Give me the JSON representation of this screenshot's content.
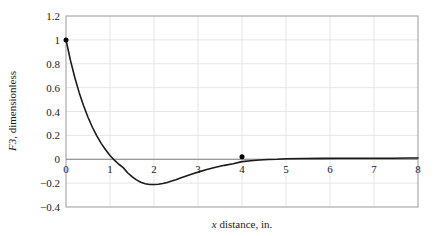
{
  "chart_data": {
    "type": "line",
    "title": "",
    "xlabel": "x distance, in.",
    "ylabel": "F3, dimensionless",
    "ylabel_italic_part": "F3",
    "ylabel_rest_part": ", dimensionless",
    "xlabel_italic_part": "x",
    "xlabel_rest_part": " distance, in.",
    "xlim": [
      0,
      8
    ],
    "ylim": [
      -0.4,
      1.2
    ],
    "xticks": [
      0,
      1,
      2,
      3,
      4,
      5,
      6,
      7,
      8
    ],
    "xticklabels": [
      "0",
      "1",
      "2",
      "3",
      "4",
      "5",
      "6",
      "7",
      "8"
    ],
    "yticks": [
      -0.4,
      -0.2,
      0,
      0.2,
      0.4,
      0.6,
      0.8,
      1,
      1.2
    ],
    "yticklabels": [
      "−0.4",
      "−0.2",
      "0",
      "0.2",
      "0.4",
      "0.6",
      "0.8",
      "1",
      "1.2"
    ],
    "grid": true,
    "grid_color": "#e6e6e6",
    "zero_line": true,
    "zero_line_color": "#808080",
    "frame_color": "#9a9a9a",
    "line_color": "#1a1a1a",
    "line_width": 1.6,
    "legend": null,
    "series": [
      {
        "name": "F3",
        "marker_points": [
          {
            "x": 0,
            "y": 1.0
          },
          {
            "x": 4,
            "y": 0.02
          }
        ],
        "marker_color": "#000000",
        "marker_size": 5,
        "x": [
          0,
          0.1,
          0.2,
          0.3,
          0.4,
          0.5,
          0.6,
          0.7,
          0.8,
          0.9,
          1.0,
          1.1,
          1.2,
          1.3,
          1.4,
          1.5,
          1.6,
          1.7,
          1.8,
          1.9,
          2.0,
          2.1,
          2.2,
          2.3,
          2.4,
          2.5,
          2.6,
          2.7,
          2.8,
          2.9,
          3.0,
          3.2,
          3.4,
          3.6,
          3.8,
          4.0,
          4.2,
          4.4,
          4.6,
          4.8,
          5.0,
          5.4,
          5.8,
          6.2,
          6.6,
          7.0,
          7.4,
          7.8,
          8.0
        ],
        "y": [
          1.0,
          0.856,
          0.725,
          0.607,
          0.501,
          0.406,
          0.322,
          0.248,
          0.183,
          0.127,
          0.078,
          0.037,
          0.002,
          -0.027,
          -0.051,
          -0.07,
          -0.086,
          -0.098,
          -0.106,
          -0.112,
          -0.115,
          -0.116,
          -0.115,
          -0.112,
          -0.108,
          -0.103,
          -0.097,
          -0.091,
          -0.085,
          -0.078,
          -0.072,
          -0.059,
          -0.047,
          -0.037,
          -0.028,
          -0.021,
          -0.015,
          -0.011,
          -0.007,
          -0.005,
          -0.003,
          -0.001,
          0.0,
          0.0,
          0.0,
          0.0,
          0.0,
          0.0,
          0.0
        ],
        "y_rendered": [
          1.0,
          0.83,
          0.685,
          0.558,
          0.448,
          0.352,
          0.268,
          0.196,
          0.133,
          0.079,
          0.032,
          -0.008,
          -0.042,
          -0.07,
          -0.113,
          -0.146,
          -0.173,
          -0.193,
          -0.205,
          -0.211,
          -0.212,
          -0.209,
          -0.203,
          -0.194,
          -0.183,
          -0.171,
          -0.158,
          -0.145,
          -0.132,
          -0.12,
          -0.108,
          -0.086,
          -0.067,
          -0.051,
          -0.037,
          -0.02,
          -0.012,
          -0.006,
          -0.002,
          0.0,
          0.004,
          0.006,
          0.007,
          0.008,
          0.008,
          0.009,
          0.009,
          0.01,
          0.01
        ],
        "min_point": {
          "x": 1.87,
          "y": -0.212
        },
        "zero_crossing_x": 1.12
      }
    ]
  }
}
